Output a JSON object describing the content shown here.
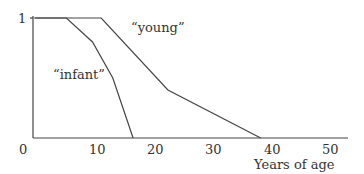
{
  "chart_data": {
    "type": "line",
    "title": "",
    "xlabel": "Years of age",
    "ylabel": "",
    "xlim": [
      0,
      53
    ],
    "ylim": [
      0,
      1
    ],
    "x_ticks": [
      "0",
      "10",
      "20",
      "30",
      "40",
      "50"
    ],
    "y_ticks": [
      "1"
    ],
    "grid": false,
    "legend": "inline annotations",
    "series": [
      {
        "name": "“infant”",
        "x": [
          0,
          5.5,
          10,
          13.5,
          17
        ],
        "y": [
          1,
          1,
          0.8,
          0.5,
          0
        ]
      },
      {
        "name": "“young”",
        "x": [
          0,
          11.5,
          23,
          39
        ],
        "y": [
          1,
          1,
          0.4,
          0
        ]
      }
    ]
  },
  "labels": {
    "y_one": "1",
    "x0": "0",
    "x10": "10",
    "x20": "20",
    "x30": "30",
    "x40": "40",
    "x50": "50",
    "xlabel": "Years of age",
    "infant": "“infant”",
    "young": "“young”"
  }
}
